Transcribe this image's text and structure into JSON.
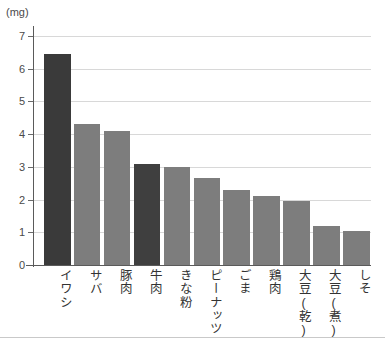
{
  "chart_data": {
    "type": "bar",
    "title": "",
    "subtitle": "",
    "xlabel": "",
    "ylabel": "",
    "unit_label": "(mg)",
    "ylim": [
      0,
      7
    ],
    "ytick_step": 1,
    "yticks": [
      "7",
      "6",
      "5",
      "4",
      "3",
      "2",
      "1",
      "0"
    ],
    "grid": true,
    "grid_axis": "y",
    "legend": "none",
    "categories": [
      "イワシ",
      "サバ",
      "豚肉",
      "牛肉",
      "きな粉",
      "ピーナッツ",
      "ごま",
      "鶏肉",
      "大豆(乾)",
      "大豆(煮)",
      "しそ"
    ],
    "values": [
      6.45,
      4.3,
      4.1,
      3.1,
      3.0,
      2.65,
      2.3,
      2.1,
      1.95,
      1.2,
      1.05
    ],
    "bar_colors": [
      "#3a3a3a",
      "#7d7d7d",
      "#7d7d7d",
      "#3f3f3f",
      "#7d7d7d",
      "#7d7d7d",
      "#7d7d7d",
      "#7d7d7d",
      "#7d7d7d",
      "#7d7d7d",
      "#7d7d7d"
    ]
  },
  "colors": {
    "background": "#ffffff",
    "bar_dark": "#3a3a3a",
    "bar_light": "#7d7d7d",
    "gridline": "#d8d8d8",
    "axis": "#5a5a5a",
    "text": "#3d3d3d"
  }
}
